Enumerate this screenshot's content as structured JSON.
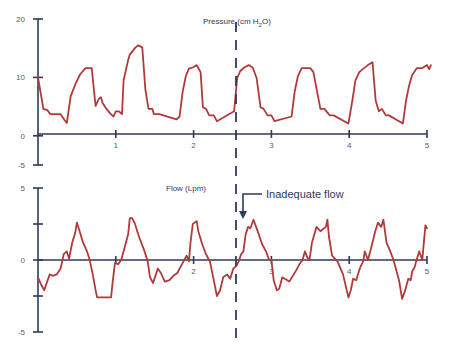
{
  "chart_data": [
    {
      "type": "line",
      "title": "Pressure (cm H2O)",
      "title_main": "Pressure (cm H",
      "title_sub": "2",
      "title_tail": "O)",
      "xlabel": "",
      "ylabel": "Pressure (cm H2O)",
      "xlim": [
        0,
        5
      ],
      "ylim": [
        -5,
        20
      ],
      "x_ticks": [
        1,
        2,
        3,
        4,
        5
      ],
      "x_tick_labels": [
        "1",
        "2",
        "3",
        "4",
        "5"
      ],
      "y_ticks": [
        20,
        10,
        0,
        -5
      ],
      "y_tick_labels": [
        "20",
        "10",
        "0",
        "-5"
      ],
      "grid": false,
      "series": [
        {
          "name": "Pressure",
          "color": "#b03a3a",
          "x": [
            0.0,
            0.07,
            0.12,
            0.16,
            0.29,
            0.34,
            0.37,
            0.42,
            0.48,
            0.54,
            0.61,
            0.65,
            0.69,
            0.74,
            0.78,
            0.81,
            0.83,
            0.88,
            0.93,
            0.97,
            1.0,
            1.04,
            1.08,
            1.1,
            1.16,
            1.18,
            1.25,
            1.29,
            1.34,
            1.38,
            1.42,
            1.47,
            1.49,
            1.53,
            1.56,
            1.78,
            1.82,
            1.86,
            1.9,
            1.94,
            1.99,
            2.04,
            2.09,
            2.12,
            2.16,
            2.2,
            2.26,
            2.3,
            2.52,
            2.56,
            2.6,
            2.65,
            2.71,
            2.76,
            2.81,
            2.86,
            2.9,
            2.95,
            3.0,
            3.04,
            3.26,
            3.3,
            3.34,
            3.39,
            3.46,
            3.5,
            3.54,
            3.63,
            3.68,
            3.75,
            3.8,
            3.99,
            4.04,
            4.08,
            4.13,
            4.19,
            4.24,
            4.3,
            4.34,
            4.38,
            4.42,
            4.47,
            4.51,
            4.69,
            4.73,
            4.77,
            4.81,
            4.87,
            4.94,
            5.0,
            5.03,
            5.05
          ],
          "values": [
            10.0,
            4.6,
            4.4,
            3.7,
            3.7,
            2.7,
            2.2,
            6.8,
            8.8,
            10.5,
            11.6,
            11.6,
            11.6,
            5.1,
            6.3,
            6.6,
            5.6,
            4.6,
            3.8,
            3.3,
            4.2,
            4.2,
            3.7,
            9.5,
            13.0,
            13.9,
            15.1,
            15.5,
            15.1,
            7.9,
            4.6,
            4.6,
            3.7,
            3.7,
            3.7,
            2.8,
            3.3,
            7.6,
            10.2,
            11.5,
            11.7,
            12.1,
            10.9,
            4.9,
            4.6,
            3.5,
            3.5,
            2.5,
            4.2,
            9.9,
            11.1,
            11.7,
            12.1,
            11.7,
            9.9,
            4.9,
            4.6,
            3.5,
            3.5,
            2.5,
            3.3,
            7.6,
            10.2,
            11.6,
            11.6,
            11.6,
            10.9,
            4.6,
            4.6,
            3.5,
            3.5,
            2.1,
            6.0,
            9.5,
            10.9,
            11.6,
            12.1,
            12.6,
            6.0,
            4.2,
            4.6,
            3.5,
            3.5,
            2.1,
            6.0,
            8.6,
            10.4,
            11.6,
            11.6,
            12.1,
            11.4,
            12.1
          ]
        }
      ],
      "annotations": [
        {
          "type": "vertical_dashed_line",
          "x": 2.58
        }
      ]
    },
    {
      "type": "line",
      "title": "Flow (Lpm)",
      "xlabel": "",
      "ylabel": "Flow (Lpm)",
      "xlim": [
        0,
        5
      ],
      "ylim": [
        -5,
        5
      ],
      "x_ticks": [
        1,
        2,
        3,
        4,
        5
      ],
      "x_tick_labels": [
        "",
        "2",
        "3",
        "4",
        "5"
      ],
      "y_ticks": [
        5,
        2.5,
        0,
        -2.5,
        -5
      ],
      "y_tick_labels": [
        "5",
        "",
        "0",
        "",
        "-5"
      ],
      "grid": false,
      "series": [
        {
          "name": "Flow",
          "color": "#b03a3a",
          "x": [
            0.0,
            0.04,
            0.08,
            0.15,
            0.19,
            0.24,
            0.29,
            0.33,
            0.37,
            0.4,
            0.44,
            0.48,
            0.5,
            0.54,
            0.58,
            0.63,
            0.66,
            0.7,
            0.74,
            0.76,
            0.91,
            0.94,
            0.96,
            0.99,
            1.03,
            1.07,
            1.11,
            1.16,
            1.18,
            1.21,
            1.24,
            1.3,
            1.37,
            1.41,
            1.44,
            1.48,
            1.54,
            1.58,
            1.63,
            1.69,
            1.74,
            1.79,
            1.82,
            1.87,
            1.91,
            1.94,
            1.96,
            1.99,
            2.04,
            2.06,
            2.11,
            2.16,
            2.21,
            2.26,
            2.3,
            2.34,
            2.38,
            2.43,
            2.47,
            2.51,
            2.55,
            2.58,
            2.61,
            2.64,
            2.67,
            2.7,
            2.73,
            2.77,
            2.83,
            2.88,
            2.93,
            2.97,
            3.0,
            3.03,
            3.07,
            3.1,
            3.14,
            3.23,
            3.32,
            3.36,
            3.4,
            3.43,
            3.46,
            3.49,
            3.52,
            3.58,
            3.63,
            3.7,
            3.72,
            3.74,
            3.78,
            3.85,
            3.92,
            3.99,
            4.02,
            4.05,
            4.09,
            4.13,
            4.15,
            4.18,
            4.2,
            4.24,
            4.28,
            4.33,
            4.37,
            4.41,
            4.44,
            4.48,
            4.52,
            4.57,
            4.64,
            4.68,
            4.72,
            4.76,
            4.79,
            4.81,
            4.84,
            4.86,
            4.9,
            4.94,
            4.98,
            5.0
          ],
          "values": [
            -1.2,
            -1.7,
            -2.1,
            -1.0,
            -1.1,
            -1.0,
            -0.6,
            0.4,
            0.6,
            0.1,
            1.2,
            1.9,
            2.6,
            1.9,
            1.2,
            0.6,
            0.1,
            -0.9,
            -2.1,
            -2.6,
            -2.6,
            -2.6,
            -1.5,
            -0.2,
            -0.3,
            0.0,
            0.8,
            1.8,
            2.9,
            2.9,
            2.6,
            1.6,
            0.6,
            -0.1,
            -1.2,
            -1.6,
            -0.6,
            -0.9,
            -1.5,
            -1.4,
            -1.1,
            -0.9,
            -0.6,
            -0.1,
            0.3,
            -0.1,
            1.2,
            2.5,
            2.7,
            2.0,
            1.1,
            0.4,
            -0.1,
            -1.4,
            -2.5,
            -2.1,
            -1.2,
            -1.0,
            -1.3,
            -0.6,
            -0.4,
            -0.1,
            0.4,
            0.6,
            1.8,
            2.3,
            2.2,
            2.8,
            1.9,
            1.1,
            0.6,
            0.0,
            0.0,
            -1.4,
            -2.1,
            -2.0,
            -1.2,
            -1.5,
            -0.7,
            -0.3,
            0.0,
            0.6,
            0.2,
            0.0,
            1.2,
            2.3,
            2.0,
            2.3,
            2.8,
            1.6,
            0.3,
            -0.1,
            -1.0,
            -2.6,
            -2.1,
            -1.3,
            -1.4,
            -0.7,
            -0.4,
            -0.1,
            0.6,
            0.0,
            0.8,
            1.9,
            2.6,
            2.3,
            2.8,
            1.2,
            0.7,
            0.0,
            -1.4,
            -2.7,
            -2.1,
            -1.3,
            -1.4,
            -0.8,
            -0.5,
            -0.1,
            0.6,
            0.0,
            2.4,
            2.2
          ]
        }
      ],
      "annotations": [
        {
          "type": "vertical_dashed_line",
          "x": 2.58
        },
        {
          "type": "arrow_label",
          "text": "Inadequate flow",
          "x": 2.66,
          "y": 2.6
        }
      ]
    }
  ],
  "labels": {
    "pressure_title_main": "Pressure (cm H",
    "pressure_title_sub": "2",
    "pressure_title_tail": "O)",
    "flow_title": "Flow (Lpm)",
    "annotation": "Inadequate flow"
  }
}
